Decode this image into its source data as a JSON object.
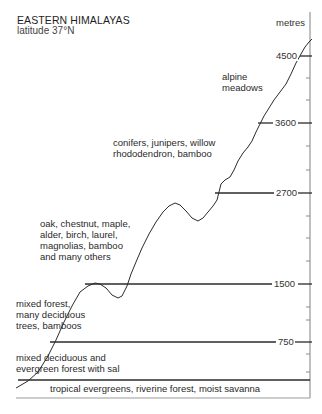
{
  "header": {
    "title": "EASTERN HIMALAYAS",
    "subtitle": "latitude 37°N"
  },
  "axis": {
    "unit_label": "metres",
    "ticks": [
      {
        "value": "4500",
        "y": 56
      },
      {
        "value": "3600",
        "y": 123
      },
      {
        "value": "2700",
        "y": 193
      },
      {
        "value": "1500",
        "y": 284
      },
      {
        "value": "750",
        "y": 342
      }
    ]
  },
  "zones": [
    {
      "id": "alpine",
      "lines": [
        "alpine",
        "meadows"
      ]
    },
    {
      "id": "conifers",
      "lines": [
        "conifers, junipers, willow",
        "rhododendron, bamboo"
      ]
    },
    {
      "id": "broadleaf",
      "lines": [
        "oak, chestnut, maple,",
        "alder, birch, laurel,",
        "magnolias, bamboo",
        "and many others"
      ]
    },
    {
      "id": "mixed-forest",
      "lines": [
        "mixed forest,",
        "many deciduous",
        "trees, bamboos"
      ]
    },
    {
      "id": "mixed-deciduous",
      "lines": [
        "mixed deciduous and",
        "evergreen forest with sal"
      ]
    },
    {
      "id": "tropical",
      "lines": [
        "tropical evergreens, riverine forest, moist savanna"
      ]
    }
  ],
  "colors": {
    "line": "#2b2b2b",
    "axis": "#777777",
    "text": "#2a2a2a"
  }
}
